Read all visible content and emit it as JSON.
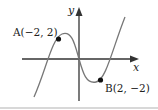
{
  "diagram": {
    "type": "function-graph",
    "axes": {
      "x_label": "x",
      "y_label": "y"
    },
    "points": [
      {
        "id": "A",
        "label": "A(−2, 2)",
        "x": -2,
        "y": 2
      },
      {
        "id": "B",
        "label": "B(2, −2)",
        "x": 2,
        "y": -2
      }
    ],
    "colors": {
      "axis": "#333333",
      "curve": "#777777",
      "point": "#111111",
      "text": "#222222"
    }
  }
}
